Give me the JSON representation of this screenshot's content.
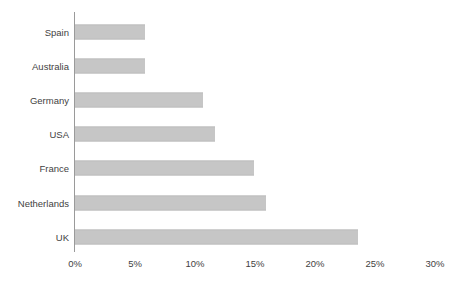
{
  "chart_data": {
    "type": "bar",
    "orientation": "horizontal",
    "title": "",
    "subtitle": "",
    "xlabel": "",
    "ylabel": "",
    "categories": [
      "Spain",
      "Australia",
      "Germany",
      "USA",
      "France",
      "Netherlands",
      "UK"
    ],
    "values": [
      5.8,
      5.8,
      10.7,
      11.7,
      14.9,
      15.9,
      23.6
    ],
    "value_labels": [
      "5.8%",
      "5.8%",
      "10.7%",
      "11.7%",
      "14.9%",
      "15.9%",
      "23.6%"
    ],
    "series": [
      {
        "name": "",
        "values": [
          5.8,
          5.8,
          10.7,
          11.7,
          14.9,
          15.9,
          23.6
        ]
      }
    ],
    "xlim": [
      0,
      30
    ],
    "x_ticks": [
      0,
      5,
      10,
      15,
      20,
      25,
      30
    ],
    "x_tick_labels": [
      "0%",
      "5%",
      "10%",
      "15%",
      "20%",
      "25%",
      "30%"
    ],
    "grid": false,
    "legend": false,
    "legend_position": "none",
    "bar_color": "#c6c6c6",
    "axis_color": "#9a9a9a",
    "text_color": "#3f3f3f",
    "background_color": "#ffffff",
    "annotations": []
  },
  "bars": [
    {
      "label": "Spain",
      "value": 5.8,
      "value_label": "5.8%"
    },
    {
      "label": "Australia",
      "value": 5.8,
      "value_label": "5.8%"
    },
    {
      "label": "Germany",
      "value": 10.7,
      "value_label": "10.7%"
    },
    {
      "label": "USA",
      "value": 11.7,
      "value_label": "11.7%"
    },
    {
      "label": "France",
      "value": 14.9,
      "value_label": "14.9%"
    },
    {
      "label": "Netherlands",
      "value": 15.9,
      "value_label": "15.9%"
    },
    {
      "label": "UK",
      "value": 23.6,
      "value_label": "23.6%"
    }
  ],
  "x_axis": {
    "ticks": [
      {
        "label": "0%",
        "value": 0
      },
      {
        "label": "5%",
        "value": 5
      },
      {
        "label": "10%",
        "value": 10
      },
      {
        "label": "15%",
        "value": 15
      },
      {
        "label": "20%",
        "value": 20
      },
      {
        "label": "25%",
        "value": 25
      },
      {
        "label": "30%",
        "value": 30
      }
    ]
  }
}
